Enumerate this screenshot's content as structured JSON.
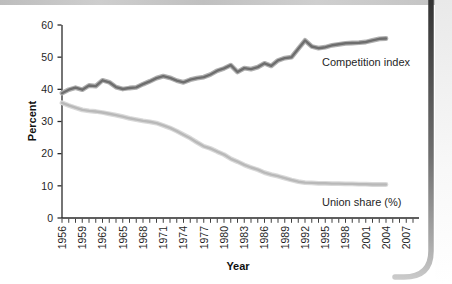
{
  "page": {
    "background": "#ffffff",
    "top_edge_color": "#c4c4c4",
    "page_edge_dark": "#383838",
    "page_edge_light": "#c6c6c6"
  },
  "chart_data": {
    "type": "line",
    "title": "",
    "xlabel": "Year",
    "ylabel": "Percent",
    "xlim": [
      1956,
      2008
    ],
    "ylim": [
      0,
      60
    ],
    "grid": false,
    "legend": "inline-annotations",
    "axis_color": "#2a2a2a",
    "text_color": "#1f1f1f",
    "y_ticks": [
      0,
      10,
      20,
      30,
      40,
      50,
      60
    ],
    "x_tick_labels": [
      1956,
      1959,
      1962,
      1965,
      1968,
      1971,
      1974,
      1977,
      1980,
      1983,
      1986,
      1989,
      1992,
      1995,
      1998,
      2001,
      2004,
      2007
    ],
    "x_minor_tick_step": 1,
    "x": [
      1956,
      1957,
      1958,
      1959,
      1960,
      1961,
      1962,
      1963,
      1964,
      1965,
      1966,
      1967,
      1968,
      1969,
      1970,
      1971,
      1972,
      1973,
      1974,
      1975,
      1976,
      1977,
      1978,
      1979,
      1980,
      1981,
      1982,
      1983,
      1984,
      1985,
      1986,
      1987,
      1988,
      1989,
      1990,
      1991,
      1992,
      1993,
      1994,
      1995,
      1996,
      1997,
      1998,
      1999,
      2000,
      2001,
      2002,
      2003,
      2004
    ],
    "series": [
      {
        "name": "Competition index",
        "color": "#6e6e6e",
        "halo_color": "#b0b0b0",
        "values": [
          38.8,
          39.9,
          40.5,
          39.9,
          41.2,
          41.0,
          42.8,
          42.2,
          40.7,
          40.1,
          40.4,
          40.6,
          41.6,
          42.5,
          43.5,
          44.1,
          43.6,
          42.7,
          42.2,
          43.0,
          43.5,
          43.8,
          44.6,
          45.8,
          46.5,
          47.5,
          45.4,
          46.6,
          46.3,
          46.9,
          48.1,
          47.3,
          49.0,
          49.7,
          50.0,
          52.6,
          55.2,
          53.3,
          52.8,
          53.1,
          53.7,
          54.0,
          54.3,
          54.4,
          54.5,
          54.7,
          55.2,
          55.7,
          55.8
        ]
      },
      {
        "name": "Union share (%)",
        "color": "#b9b9b9",
        "halo_color": "#d9d9d9",
        "values": [
          35.8,
          35.0,
          34.3,
          33.6,
          33.3,
          33.1,
          32.8,
          32.4,
          32.0,
          31.5,
          31.0,
          30.6,
          30.2,
          29.9,
          29.5,
          28.8,
          28.0,
          27.0,
          25.9,
          24.8,
          23.5,
          22.3,
          21.6,
          20.6,
          19.7,
          18.4,
          17.5,
          16.5,
          15.7,
          15.0,
          14.1,
          13.5,
          13.0,
          12.4,
          11.8,
          11.3,
          11.0,
          10.9,
          10.8,
          10.8,
          10.7,
          10.7,
          10.6,
          10.6,
          10.5,
          10.5,
          10.4,
          10.4,
          10.4
        ]
      }
    ]
  }
}
